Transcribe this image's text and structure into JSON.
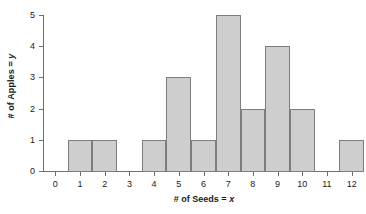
{
  "chart_data": {
    "type": "bar",
    "title": "",
    "subtitle": "",
    "xlabel_text": "# of Seeds = ",
    "xlabel_var": "x",
    "ylabel_text": "# of Apples = ",
    "ylabel_var": "y",
    "categories": [
      "0",
      "1",
      "2",
      "3",
      "4",
      "5",
      "6",
      "7",
      "8",
      "9",
      "10",
      "11",
      "12"
    ],
    "values": [
      0,
      1,
      1,
      0,
      1,
      3,
      1,
      5,
      2,
      4,
      2,
      0,
      1
    ],
    "xtick_labels": [
      "0",
      "1",
      "2",
      "3",
      "4",
      "5",
      "6",
      "7",
      "8",
      "9",
      "10",
      "11",
      "12"
    ],
    "ytick_labels": [
      "0",
      "1",
      "2",
      "3",
      "4",
      "5"
    ],
    "ytick_values": [
      0,
      1,
      2,
      3,
      4,
      5
    ],
    "xlim": [
      -0.5,
      12.5
    ],
    "ylim": [
      0,
      5
    ],
    "grid": false,
    "legend": false,
    "bar_fill_color": "#cecece",
    "bar_edge_color": "#7d7d7d",
    "axis_color": "#6e6e6e",
    "text_color": "#1a1a1a",
    "background_color": "#ffffff",
    "bar_width": 1
  }
}
